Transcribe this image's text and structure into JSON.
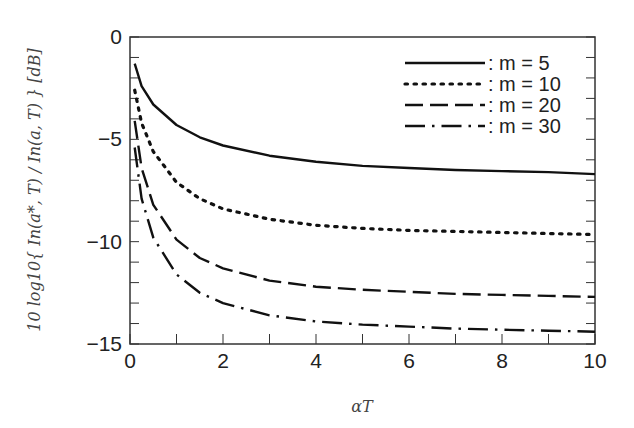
{
  "chart_data": {
    "type": "line",
    "title": "",
    "xlabel": "αT",
    "ylabel": "10 log10{ In(a*, T) / In(a, T) } [dB]",
    "xlim": [
      0,
      10
    ],
    "ylim": [
      -15,
      0
    ],
    "x_ticks": [
      "0",
      "2",
      "4",
      "6",
      "8",
      "10"
    ],
    "y_ticks": [
      "0",
      "-5",
      "-10",
      "-15"
    ],
    "grid": false,
    "legend_position": "upper right",
    "x": [
      0.1,
      0.25,
      0.5,
      1,
      1.5,
      2,
      3,
      4,
      5,
      6,
      7,
      8,
      9,
      10
    ],
    "series": [
      {
        "name": ": m = 5",
        "style": "solid",
        "values": [
          -1.3,
          -2.4,
          -3.3,
          -4.3,
          -4.9,
          -5.3,
          -5.8,
          -6.1,
          -6.3,
          -6.4,
          -6.5,
          -6.55,
          -6.6,
          -6.7
        ]
      },
      {
        "name": ": m = 10",
        "style": "dotted",
        "values": [
          -2.6,
          -4.2,
          -5.6,
          -7.1,
          -7.9,
          -8.4,
          -8.9,
          -9.2,
          -9.35,
          -9.45,
          -9.5,
          -9.55,
          -9.6,
          -9.65
        ]
      },
      {
        "name": ": m = 20",
        "style": "dashed",
        "values": [
          -4.1,
          -6.4,
          -8.2,
          -9.9,
          -10.8,
          -11.3,
          -11.9,
          -12.2,
          -12.35,
          -12.45,
          -12.55,
          -12.6,
          -12.65,
          -12.7
        ]
      },
      {
        "name": ": m = 30",
        "style": "dashdot",
        "values": [
          -5.4,
          -7.9,
          -9.8,
          -11.6,
          -12.5,
          -13.0,
          -13.6,
          -13.9,
          -14.05,
          -14.15,
          -14.25,
          -14.3,
          -14.35,
          -14.4
        ]
      }
    ]
  }
}
